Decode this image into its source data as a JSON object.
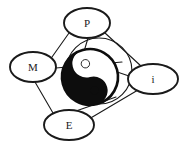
{
  "figure": {
    "name": "taijitu-node-diagram",
    "background_color": "#ffffff",
    "stroke_color": "#1a1a1a",
    "fill_dark": "#0d0d0d",
    "fill_light": "#ffffff"
  },
  "nodes": [
    {
      "id": "p",
      "label": "P",
      "cx": 87,
      "cy": 23,
      "rx": 23,
      "ry": 15
    },
    {
      "id": "m",
      "label": "M",
      "cx": 33,
      "cy": 67,
      "rx": 23,
      "ry": 15
    },
    {
      "id": "i",
      "label": "i",
      "cx": 153,
      "cy": 79,
      "rx": 25,
      "ry": 15
    },
    {
      "id": "e",
      "label": "E",
      "cx": 69,
      "cy": 125,
      "rx": 25,
      "ry": 15
    }
  ],
  "edges": [
    {
      "from": "m",
      "to": "p",
      "x1": 52,
      "y1": 57,
      "x2": 69,
      "y2": 33
    },
    {
      "from": "p",
      "to": "i",
      "x1": 105,
      "y1": 33,
      "x2": 141,
      "y2": 66
    },
    {
      "from": "i",
      "to": "e",
      "x1": 138,
      "y1": 90,
      "x2": 89,
      "y2": 119
    },
    {
      "from": "e",
      "to": "m",
      "x1": 53,
      "y1": 113,
      "x2": 35,
      "y2": 82
    },
    {
      "from": "p",
      "to": "center",
      "x1": 88,
      "y1": 38,
      "x2": 78,
      "y2": 72
    },
    {
      "from": "m",
      "to": "center",
      "x1": 56,
      "y1": 68,
      "x2": 122,
      "y2": 62
    },
    {
      "from": "i",
      "to": "center",
      "x1": 129,
      "y1": 76,
      "x2": 70,
      "y2": 56
    },
    {
      "from": "e",
      "to": "center",
      "x1": 76,
      "y1": 111,
      "x2": 116,
      "y2": 97
    }
  ],
  "center_symbol": {
    "name": "taijitu",
    "outer_circle": {
      "cx": 99,
      "cy": 71,
      "r": 33
    },
    "taiji": {
      "cx": 90,
      "cy": 77,
      "r": 28
    },
    "yang_dot": {
      "cx": 77,
      "cy": 67,
      "r": 4,
      "color": "#ffffff"
    },
    "yin_dot": {
      "cx": 104,
      "cy": 70,
      "r": 4,
      "color": "#0d0d0d"
    }
  }
}
